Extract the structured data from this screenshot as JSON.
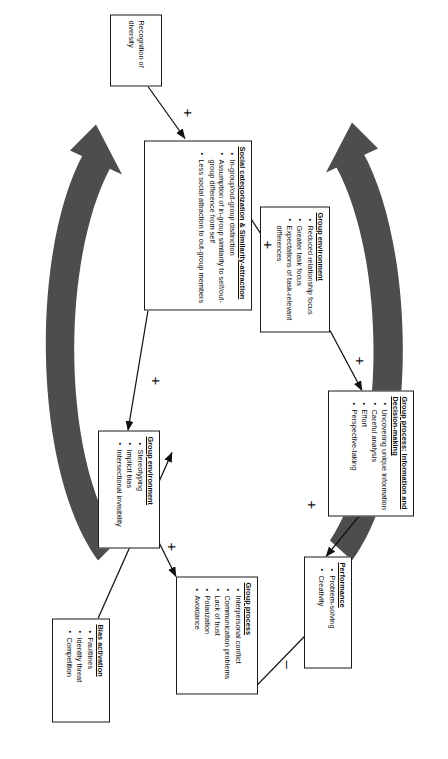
{
  "diagram": {
    "orientation": "rotated-90-clockwise",
    "colors": {
      "box_border": "#1a1a1a",
      "line": "#111111",
      "big_arrow": "#4d4d4d",
      "background": "#ffffff"
    },
    "nodes": [
      {
        "id": "recognition",
        "title": "Recognition of diversity",
        "items": []
      },
      {
        "id": "social-categorization",
        "title": "Social categorization & Similarity-attraction",
        "items": [
          "In-group/out-group distinction",
          "Assumption of in-group similarity to self/out-group difference from self",
          "Less social attraction to out-group members"
        ]
      },
      {
        "id": "bias-activation",
        "title": "Bias activation",
        "items": [
          "Faultlines",
          "Identity threat",
          "Competition"
        ]
      },
      {
        "id": "group-environment-positive",
        "title": "Group environment",
        "items": [
          "Reduced relationship focus",
          "Greater task focus",
          "Expectations of task-relevant differences"
        ]
      },
      {
        "id": "group-environment-negative",
        "title": "Group environment",
        "items": [
          "Stereotyping",
          "Implicit bias",
          "Intersectional invisibility"
        ]
      },
      {
        "id": "group-process-info",
        "title": "Group process: Information and Decision-making",
        "items": [
          "Uncovering unique information",
          "Careful analysis",
          "Effort",
          "Perspective-taking"
        ]
      },
      {
        "id": "group-process-negative",
        "title": "Group process",
        "items": [
          "Interpersonal conflict",
          "Communication problems",
          "Lack of trust",
          "Polarization",
          "Avoidance"
        ]
      },
      {
        "id": "performance",
        "title": "Performance",
        "items": [
          "Problem-solving",
          "Creativity"
        ]
      }
    ],
    "signs": [
      {
        "id": "sign-recognition-to-socialcat",
        "symbol": "+"
      },
      {
        "id": "sign-socialcat-to-groupenv-positive",
        "symbol": "+"
      },
      {
        "id": "sign-socialcat-to-groupenv-negative",
        "symbol": "+"
      },
      {
        "id": "sign-groupenv-positive-to-process",
        "symbol": "+"
      },
      {
        "id": "sign-groupenv-negative-to-process",
        "symbol": "+"
      },
      {
        "id": "sign-process-info-to-performance",
        "symbol": "+"
      },
      {
        "id": "sign-process-negative-to-performance",
        "symbol": "–"
      }
    ]
  }
}
